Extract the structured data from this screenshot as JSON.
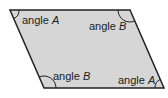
{
  "diagram": {
    "shape": "parallelogram",
    "fill": "#d6d6d6",
    "stroke": "#222222",
    "labels": [
      {
        "word": "angle",
        "var": "A",
        "corner": "top-left"
      },
      {
        "word": "angle",
        "var": "B",
        "corner": "top-right"
      },
      {
        "word": "angle",
        "var": "B",
        "corner": "bottom-left"
      },
      {
        "word": "angle",
        "var": "A",
        "corner": "bottom-right"
      }
    ]
  }
}
